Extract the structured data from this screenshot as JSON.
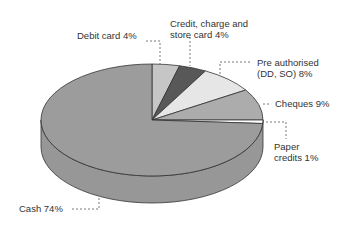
{
  "chart_data": {
    "type": "pie",
    "style": "3d",
    "title": "",
    "slices": [
      {
        "label": "Debit card",
        "value": 4,
        "color": "#c6c6c6",
        "text": "Debit card 4%"
      },
      {
        "label": "Credit, charge and store card",
        "value": 4,
        "color": "#585858",
        "text_lines": [
          "Credit, charge and",
          "store card 4%"
        ]
      },
      {
        "label": "Pre authorised (DD, SO)",
        "value": 8,
        "color": "#e6e6e6",
        "text_lines": [
          "Pre authorised",
          "(DD, SO) 8%"
        ]
      },
      {
        "label": "Cheques",
        "value": 9,
        "color": "#acacac",
        "text": "Cheques 9%"
      },
      {
        "label": "Paper credits",
        "value": 1,
        "color": "#ffffff",
        "text_lines": [
          "Paper",
          "credits 1%"
        ]
      },
      {
        "label": "Cash",
        "value": 74,
        "color": "#9c9c9c",
        "text": "Cash 74%"
      }
    ],
    "start_angle": "12 o'clock",
    "direction": "clockwise",
    "legend": "none (leader-line labels)"
  },
  "labels": {
    "debit": "Debit card 4%",
    "credit_line1": "Credit, charge and",
    "credit_line2": "store card 4%",
    "preauth_line1": "Pre authorised",
    "preauth_line2": "(DD, SO) 8%",
    "cheques": "Cheques 9%",
    "paper_line1": "Paper",
    "paper_line2": "credits 1%",
    "cash": "Cash 74%"
  },
  "geometry": {
    "cx": 152,
    "cy": 120,
    "rx": 111,
    "ry": 56,
    "depth": 27,
    "side_color": "#979797",
    "edge_color": "#333333"
  }
}
